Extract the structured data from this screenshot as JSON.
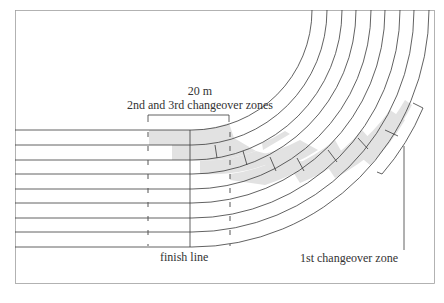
{
  "diagram": {
    "labels": {
      "distance": "20 m",
      "zones_2_3": "2nd and 3rd changeover zones",
      "finish_line": "finish line",
      "zone_1": "1st changeover zone"
    },
    "lanes": 8,
    "colors": {
      "line": "#3a3a3a",
      "zone_fill": "#e2e2e2",
      "frame": "#9a9a9a",
      "background": "#ffffff"
    }
  }
}
